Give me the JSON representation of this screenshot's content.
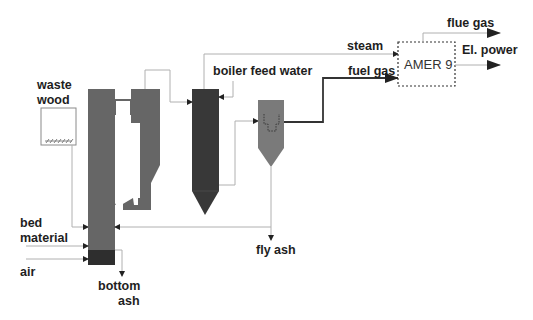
{
  "labels": {
    "waste_wood_line1": "waste",
    "waste_wood_line2": "wood",
    "bed_material_line1": "bed",
    "bed_material_line2": "material",
    "air": "air",
    "bottom_ash_line1": "bottom",
    "bottom_ash_line2": "ash",
    "boiler_feed_water": "boiler feed water",
    "steam": "steam",
    "fuel_gas": "fuel gas",
    "fly_ash": "fly ash",
    "flue_gas": "flue gas",
    "el_power": "El. power",
    "amer_unit": "AMER 9"
  },
  "colors": {
    "gasifier": "#666666",
    "gasifier_bottom": "#2e2e2e",
    "boiler": "#383838",
    "cyclone": "#7a7a7a",
    "thin_line": "#b0b0b0",
    "thick_line": "#333333",
    "text": "#1e1e1e"
  },
  "components": [
    {
      "name": "waste wood hopper"
    },
    {
      "name": "CFB gasifier"
    },
    {
      "name": "boiler / heat exchanger"
    },
    {
      "name": "gas filter / cyclone"
    },
    {
      "name": "AMER 9 power plant"
    }
  ]
}
